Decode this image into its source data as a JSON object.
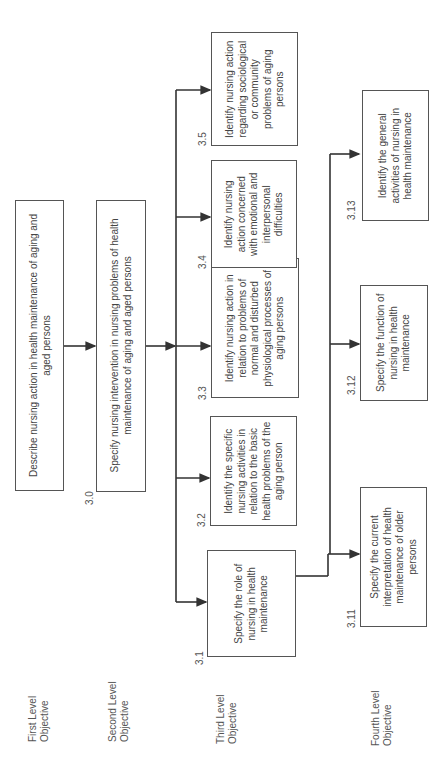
{
  "levels": [
    {
      "line1": "First Level",
      "line2": "Objective"
    },
    {
      "line1": "Second Level",
      "line2": "Objective"
    },
    {
      "line1": "Third Level",
      "line2": "Objective"
    },
    {
      "line1": "Fourth Level",
      "line2": "Objective"
    }
  ],
  "first_level": {
    "text": "Describe nursing action in health maintenance of aging and aged persons"
  },
  "second_level": {
    "number": "3.0",
    "text": "Specify nursing intervention in nursing problems of health maintenance of aging and aged persons"
  },
  "third_level": [
    {
      "number": "3.1",
      "text": "Specify the role of nursing in health maintenance"
    },
    {
      "number": "3.2",
      "text": "Identify the specific nursing activities in relation to the basic health problems of the aging person"
    },
    {
      "number": "3.3",
      "text": "Identify nursing action in relation to problems of normal and disturbed physiological processes of aging persons"
    },
    {
      "number": "3.4",
      "text": "Identify nursing action concerned with emotional and interpersonal difficulties"
    },
    {
      "number": "3.5",
      "text": "Identify nursing action regarding sociological or community problems of aging persons"
    }
  ],
  "fourth_level": [
    {
      "number": "3.11",
      "text": "Specify the current interpretation of health maintenance of older persons"
    },
    {
      "number": "3.12",
      "text": "Specify the function of nursing in health maintenance"
    },
    {
      "number": "3.13",
      "text": "Identify the general activities of nursing in health maintenance"
    }
  ]
}
